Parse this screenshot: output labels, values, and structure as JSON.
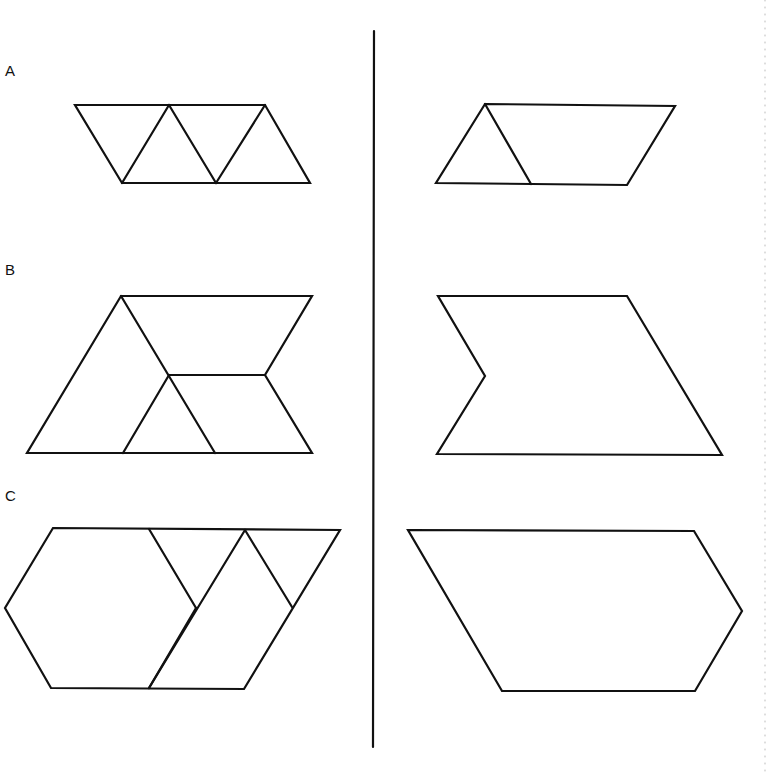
{
  "rows": [
    {
      "label": "A",
      "label_pos": [
        5,
        63
      ],
      "left": {
        "outline": [
          [
            75,
            105
          ],
          [
            265,
            105
          ],
          [
            310,
            183
          ],
          [
            122,
            183
          ]
        ],
        "inner_lines": [
          [
            [
              169,
              105
            ],
            [
              122,
              183
            ]
          ],
          [
            [
              169,
              105
            ],
            [
              216,
              183
            ]
          ],
          [
            [
              265,
              105
            ],
            [
              216,
              183
            ]
          ]
        ]
      },
      "right": {
        "outline": [
          [
            485,
            104
          ],
          [
            675,
            106
          ],
          [
            627,
            185
          ],
          [
            436,
            183
          ]
        ],
        "inner_lines": [
          [
            [
              485,
              104
            ],
            [
              531,
              184
            ]
          ]
        ]
      }
    },
    {
      "label": "B",
      "label_pos": [
        5,
        262
      ],
      "left": {
        "outline": [
          [
            121,
            296
          ],
          [
            312,
            296
          ],
          [
            265,
            375
          ],
          [
            312,
            453
          ],
          [
            27,
            453
          ]
        ],
        "inner_lines": [
          [
            [
              121,
              296
            ],
            [
              215,
              453
            ]
          ],
          [
            [
              169,
              375
            ],
            [
              265,
              375
            ]
          ],
          [
            [
              169,
              375
            ],
            [
              123,
              453
            ]
          ]
        ]
      },
      "right": {
        "outline": [
          [
            438,
            296
          ],
          [
            627,
            296
          ],
          [
            722,
            455
          ],
          [
            437,
            454
          ],
          [
            485,
            376
          ]
        ],
        "inner_lines": []
      }
    },
    {
      "label": "C",
      "label_pos": [
        5,
        488
      ],
      "left": {
        "outline": [
          [
            53,
            528
          ],
          [
            340,
            530
          ],
          [
            244,
            689
          ],
          [
            51,
            688
          ],
          [
            5,
            608
          ]
        ],
        "inner_lines": [
          [
            [
              149,
              529
            ],
            [
              196,
              608
            ]
          ],
          [
            [
              196,
              608
            ],
            [
              149,
              688
            ]
          ],
          [
            [
              245,
              530
            ],
            [
              149,
              688
            ]
          ],
          [
            [
              245,
              530
            ],
            [
              292,
              607
            ]
          ]
        ]
      },
      "right": {
        "outline": [
          [
            408,
            530
          ],
          [
            694,
            531
          ],
          [
            742,
            611
          ],
          [
            695,
            691
          ],
          [
            502,
            691
          ]
        ],
        "inner_lines": []
      }
    }
  ],
  "divider": {
    "x1": 374,
    "y1": 31,
    "x2": 373,
    "y2": 747
  },
  "colors": {
    "stroke": "#111111",
    "background": "#ffffff"
  }
}
